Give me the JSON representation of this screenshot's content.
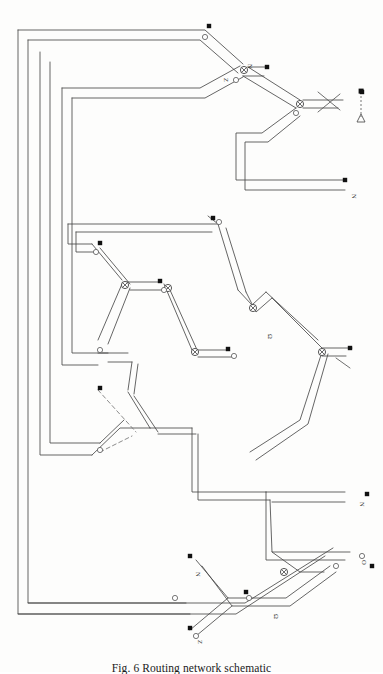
{
  "figure": {
    "caption_label": "Fig. 6",
    "caption_text": "Fig. 6  Routing network schematic",
    "background_color": "#fdfdfc",
    "line_color": "#4a4a4a",
    "node_fill_color": "#111111",
    "dash_color": "#6e6e6e"
  },
  "legend": {
    "square_symbol": "filled-square",
    "triangle_symbol": "open-triangle",
    "connector_symbol": "vertical-dashed-line"
  },
  "terminal_labels": [
    {
      "id": "t-top-right",
      "text": "N",
      "x": 352,
      "y": 190
    },
    {
      "id": "t-mid-right",
      "text": "Ω",
      "x": 268,
      "y": 332
    },
    {
      "id": "t-low-right-n",
      "text": "N",
      "x": 358,
      "y": 505
    },
    {
      "id": "t-low-right-o",
      "text": "O",
      "x": 360,
      "y": 562
    },
    {
      "id": "t-bottom-mid",
      "text": "Ω",
      "x": 272,
      "y": 612
    },
    {
      "id": "t-bottom-left",
      "text": "Z",
      "x": 210,
      "y": 640
    },
    {
      "id": "t-node-a",
      "text": "N",
      "x": 196,
      "y": 570
    },
    {
      "id": "t-node-b",
      "text": "Z",
      "x": 223,
      "y": 76
    },
    {
      "id": "t-node-c",
      "text": "N",
      "x": 248,
      "y": 62
    }
  ],
  "channels": [
    {
      "id": "ch-outer-1",
      "d": "M 18 28 L 18 612 L 232 612 L 320 555"
    },
    {
      "id": "ch-outer-2",
      "d": "M 28 36 L 28 600 L 243 600 L 330 548"
    },
    {
      "id": "ch-outer-3",
      "d": "M 40 46 L 40 452 L 96 452"
    },
    {
      "id": "ch-outer-4",
      "d": "M 50 56 L 50 440 L 106 440"
    },
    {
      "id": "ch-outer-5",
      "d": "M 62 80 L 62 362 L 100 362"
    },
    {
      "id": "ch-outer-6",
      "d": "M 72 92 L 72 350 L 110 350"
    }
  ],
  "nodes": {
    "junction_count": 9,
    "square_terminal_count": 14,
    "circle_node_count": 12
  },
  "paths": {
    "top_branch": "top-left rectangle stack feeding a central circled-X junction",
    "mid_branch": "hexagonal loop network with dashed bypass",
    "bottom_branch": "lower right return loop"
  }
}
